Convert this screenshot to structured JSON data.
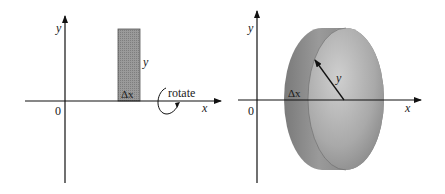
{
  "left_panel": {
    "axis_x_label": "x",
    "axis_y_label": "y",
    "origin_label": "0",
    "strip_height_label": "y",
    "strip_width_label": "Δx",
    "rotate_label": "rotate"
  },
  "right_panel": {
    "axis_x_label": "x",
    "axis_y_label": "y",
    "origin_label": "0",
    "radius_label": "y",
    "thickness_label": "Δx"
  },
  "colors": {
    "axis": "#111111",
    "strip_fill": "#8f8f8f",
    "disk_light": "#c4c4c4",
    "disk_dark": "#6e6e6e"
  }
}
